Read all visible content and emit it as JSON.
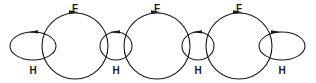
{
  "diagram": {
    "stroke_color": "#1a1a1a",
    "background_color": "#ffffff",
    "width": 316,
    "height": 83,
    "large_circles": [
      {
        "id": "large-circle-1",
        "label": "F",
        "cx": 75,
        "cy": 46,
        "r": 33,
        "label_x": 75,
        "label_y": 8,
        "arrow_direction": "clockwise",
        "arrow_x": 75,
        "arrow_y": 13
      },
      {
        "id": "large-circle-2",
        "label": "F",
        "cx": 157,
        "cy": 46,
        "r": 33,
        "label_x": 157,
        "label_y": 8,
        "arrow_direction": "clockwise",
        "arrow_x": 157,
        "arrow_y": 13
      },
      {
        "id": "large-circle-3",
        "label": "F",
        "cx": 239,
        "cy": 46,
        "r": 33,
        "label_x": 239,
        "label_y": 8,
        "arrow_direction": "clockwise",
        "arrow_x": 239,
        "arrow_y": 13
      }
    ],
    "small_ellipses": [
      {
        "id": "small-ellipse-1",
        "label": "H",
        "cx": 33,
        "cy": 46,
        "rx": 23,
        "ry": 14,
        "label_x": 33,
        "label_y": 71,
        "arrow_direction": "counterclockwise",
        "arrow_x": 33,
        "arrow_y": 32
      },
      {
        "id": "small-ellipse-2",
        "label": "H",
        "cx": 116,
        "cy": 46,
        "rx": 16,
        "ry": 14,
        "label_x": 116,
        "label_y": 71,
        "arrow_direction": "counterclockwise",
        "arrow_x": 116,
        "arrow_y": 32
      },
      {
        "id": "small-ellipse-3",
        "label": "H",
        "cx": 198,
        "cy": 46,
        "rx": 16,
        "ry": 14,
        "label_x": 198,
        "label_y": 71,
        "arrow_direction": "counterclockwise",
        "arrow_x": 198,
        "arrow_y": 32
      },
      {
        "id": "small-ellipse-4",
        "label": "H",
        "cx": 282,
        "cy": 46,
        "rx": 23,
        "ry": 14,
        "label_x": 282,
        "label_y": 71,
        "arrow_direction": "clockwise",
        "arrow_x": 276,
        "arrow_y": 32
      }
    ]
  }
}
